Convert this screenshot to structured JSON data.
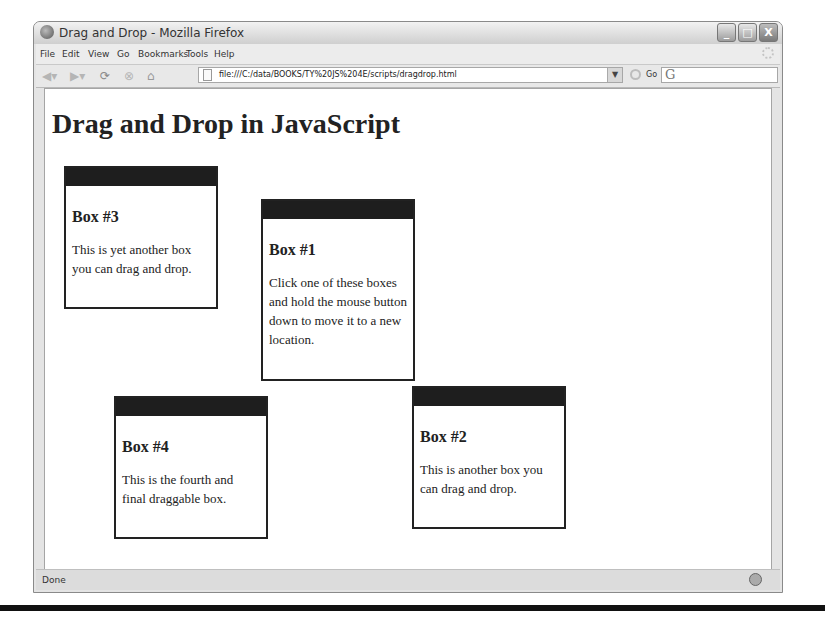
{
  "window": {
    "title": "Drag and Drop - Mozilla Firefox",
    "controls": {
      "minimize": "_",
      "maximize": "□",
      "close": "X"
    }
  },
  "menubar": {
    "items": [
      {
        "label": "File"
      },
      {
        "label": "Edit"
      },
      {
        "label": "View"
      },
      {
        "label": "Go"
      },
      {
        "label": "Bookmarks"
      },
      {
        "label": "Tools"
      },
      {
        "label": "Help"
      }
    ]
  },
  "navbar": {
    "icons": [
      "back-icon",
      "forward-icon",
      "reload-icon",
      "stop-icon",
      "home-icon"
    ],
    "url": "file:///C:/data/BOOKS/TY%20JS%204E/scripts/dragdrop.html",
    "go_label": "Go",
    "search_engine_glyph": "G"
  },
  "page": {
    "heading": "Drag and Drop in JavaScript",
    "boxes": [
      {
        "title": "Box #1",
        "text": "Click one of these boxes and hold the mouse button down to move it to a new location."
      },
      {
        "title": "Box #2",
        "text": "This is another box you can drag and drop."
      },
      {
        "title": "Box #3",
        "text": "This is yet another box you can drag and drop."
      },
      {
        "title": "Box #4",
        "text": "This is the fourth and final draggable box."
      }
    ]
  },
  "statusbar": {
    "text": "Done"
  }
}
